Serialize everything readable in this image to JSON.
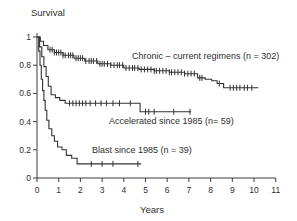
{
  "chart_data": {
    "type": "line",
    "subtype": "kaplan-meier-step-survival",
    "title": "",
    "ylabel": "Survival",
    "xlabel": "Years",
    "xlim": [
      0,
      11
    ],
    "ylim": [
      0,
      1
    ],
    "grid": false,
    "legend_position": "inline-annotations",
    "axis_color": "#3c3c3c",
    "line_color": "#333333",
    "text_color": "#2e2e2e",
    "x_ticks": [
      {
        "v": 0,
        "label": "0"
      },
      {
        "v": 1,
        "label": "1"
      },
      {
        "v": 2,
        "label": "2"
      },
      {
        "v": 3,
        "label": "3"
      },
      {
        "v": 4,
        "label": "4"
      },
      {
        "v": 5,
        "label": "5"
      },
      {
        "v": 6,
        "label": "6"
      },
      {
        "v": 7,
        "label": "7"
      },
      {
        "v": 8,
        "label": "8"
      },
      {
        "v": 9,
        "label": "9"
      },
      {
        "v": 10,
        "label": "10"
      },
      {
        "v": 11,
        "label": "11"
      }
    ],
    "y_ticks": [
      {
        "v": 0,
        "label": "0"
      },
      {
        "v": 0.2,
        "label": "0.2"
      },
      {
        "v": 0.4,
        "label": "0.4"
      },
      {
        "v": 0.6,
        "label": "0.6"
      },
      {
        "v": 0.8,
        "label": "0.8"
      },
      {
        "v": 1,
        "label": "1"
      }
    ],
    "series": [
      {
        "name": "Chronic – current regimens (n = 302)",
        "n": 302,
        "points": [
          [
            0,
            1.0
          ],
          [
            0.15,
            0.97
          ],
          [
            0.3,
            0.94
          ],
          [
            0.5,
            0.91
          ],
          [
            0.8,
            0.89
          ],
          [
            1.2,
            0.87
          ],
          [
            1.7,
            0.85
          ],
          [
            2.2,
            0.83
          ],
          [
            2.8,
            0.81
          ],
          [
            3.4,
            0.8
          ],
          [
            4.0,
            0.78
          ],
          [
            4.7,
            0.77
          ],
          [
            5.4,
            0.76
          ],
          [
            6.1,
            0.75
          ],
          [
            6.8,
            0.74
          ],
          [
            7.4,
            0.71
          ],
          [
            7.75,
            0.7
          ],
          [
            8.05,
            0.69
          ],
          [
            8.3,
            0.67
          ],
          [
            8.6,
            0.64
          ],
          [
            10.2,
            0.64
          ]
        ],
        "censors": [
          0.6,
          0.7,
          0.8,
          0.9,
          1.0,
          1.1,
          1.2,
          1.3,
          1.45,
          1.55,
          1.65,
          1.8,
          1.9,
          2.0,
          2.1,
          2.25,
          2.4,
          2.5,
          2.6,
          2.75,
          2.9,
          3.0,
          3.1,
          3.25,
          3.4,
          3.55,
          3.7,
          3.8,
          3.95,
          4.1,
          4.25,
          4.4,
          4.5,
          4.65,
          4.8,
          4.95,
          5.1,
          5.25,
          5.4,
          5.5,
          5.65,
          5.8,
          5.95,
          6.1,
          6.2,
          6.35,
          6.5,
          6.65,
          6.8,
          6.95,
          7.1,
          7.25,
          7.5,
          7.6,
          8.4,
          8.9,
          9.05,
          9.2,
          9.35,
          9.55,
          9.7,
          9.9
        ]
      },
      {
        "name": "Accelerated since 1985 (n= 59)",
        "n": 59,
        "points": [
          [
            0,
            1.0
          ],
          [
            0.12,
            0.93
          ],
          [
            0.22,
            0.86
          ],
          [
            0.32,
            0.79
          ],
          [
            0.42,
            0.72
          ],
          [
            0.52,
            0.65
          ],
          [
            0.65,
            0.59
          ],
          [
            0.85,
            0.57
          ],
          [
            1.05,
            0.55
          ],
          [
            1.3,
            0.53
          ],
          [
            4.75,
            0.47
          ],
          [
            7.1,
            0.47
          ]
        ],
        "censors": [
          1.5,
          1.65,
          1.8,
          1.95,
          2.1,
          2.25,
          2.45,
          2.7,
          2.95,
          3.2,
          3.5,
          3.8,
          4.3,
          5.0,
          5.15,
          5.4,
          6.3,
          7.05
        ]
      },
      {
        "name": "Blast since 1985 (n = 39)",
        "n": 39,
        "points": [
          [
            0,
            1.0
          ],
          [
            0.08,
            0.9
          ],
          [
            0.14,
            0.8
          ],
          [
            0.2,
            0.7
          ],
          [
            0.26,
            0.62
          ],
          [
            0.32,
            0.55
          ],
          [
            0.38,
            0.48
          ],
          [
            0.45,
            0.41
          ],
          [
            0.55,
            0.35
          ],
          [
            0.68,
            0.3
          ],
          [
            0.8,
            0.26
          ],
          [
            0.95,
            0.22
          ],
          [
            1.15,
            0.2
          ],
          [
            1.35,
            0.16
          ],
          [
            1.6,
            0.14
          ],
          [
            1.85,
            0.1
          ],
          [
            4.8,
            0.1
          ]
        ],
        "censors": [
          2.5,
          3.0,
          3.5,
          4.65
        ]
      }
    ]
  }
}
